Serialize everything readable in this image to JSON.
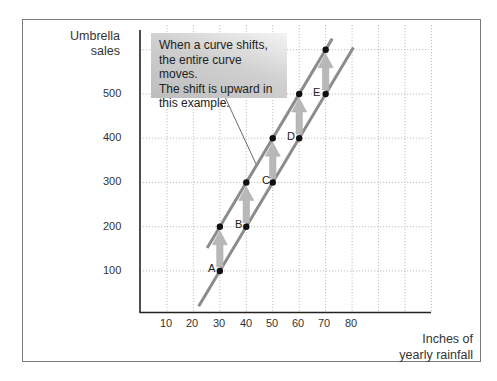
{
  "chart_data": {
    "type": "line",
    "title": "",
    "ylabel": "Umbrella sales",
    "xlabel": "Inches of yearly rainfall",
    "x_ticks": [
      10,
      20,
      30,
      40,
      50,
      60,
      70,
      80
    ],
    "y_ticks": [
      100,
      200,
      300,
      400,
      500
    ],
    "xlim": [
      0,
      110
    ],
    "ylim": [
      0,
      650
    ],
    "grid": true,
    "series": [
      {
        "name": "Original curve",
        "points": [
          {
            "label": "A",
            "x": 30,
            "y": 100
          },
          {
            "label": "B",
            "x": 40,
            "y": 200
          },
          {
            "label": "C",
            "x": 50,
            "y": 300
          },
          {
            "label": "D",
            "x": 60,
            "y": 400
          },
          {
            "label": "E",
            "x": 70,
            "y": 500
          }
        ],
        "line_extent": {
          "x_start": 22,
          "x_end": 80.5
        }
      },
      {
        "name": "Shifted curve",
        "points": [
          {
            "x": 30,
            "y": 200
          },
          {
            "x": 40,
            "y": 300
          },
          {
            "x": 50,
            "y": 400
          },
          {
            "x": 60,
            "y": 500
          },
          {
            "x": 70,
            "y": 600
          }
        ],
        "line_extent": {
          "x_start": 25.2,
          "x_end": 72.5
        }
      }
    ],
    "arrows": [
      {
        "x": 30,
        "from": 100,
        "to": 200
      },
      {
        "x": 40,
        "from": 200,
        "to": 300
      },
      {
        "x": 50,
        "from": 300,
        "to": 400
      },
      {
        "x": 60,
        "from": 400,
        "to": 500
      },
      {
        "x": 70,
        "from": 500,
        "to": 600
      }
    ],
    "annotation": "When a curve shifts, the entire curve moves. The shift is upward in this example."
  },
  "labels": {
    "y_axis_line1": "Umbrella",
    "y_axis_line2": "sales",
    "x_axis_line1": "Inches of",
    "x_axis_line2": "yearly rainfall",
    "callout_lines": [
      "When a curve shifts,",
      "the entire curve moves.",
      "The shift is upward in",
      "this example."
    ],
    "point_labels": [
      "A",
      "B",
      "C",
      "D",
      "E"
    ],
    "x_ticks": [
      "10",
      "20",
      "30",
      "40",
      "50",
      "60",
      "70",
      "80"
    ],
    "y_ticks": [
      "100",
      "200",
      "300",
      "400",
      "500"
    ]
  },
  "colors": {
    "curve": "#8c8c8c",
    "arrow": "#b8b8b8",
    "point": "#111111",
    "grid": "#b0b0b0",
    "axis": "#222222"
  }
}
